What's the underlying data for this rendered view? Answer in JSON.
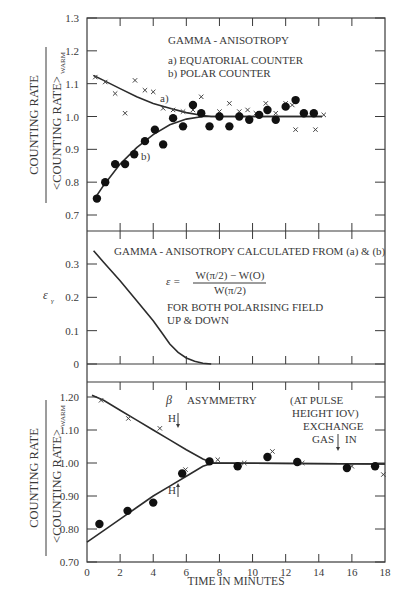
{
  "chart_data": [
    {
      "type": "scatter",
      "panel": "top",
      "title": "GAMMA - ANISOTROPY",
      "legend": [
        "a) EQUATORIAL COUNTER",
        "b) POLAR COUNTER"
      ],
      "curve_labels": [
        "a)",
        "b)"
      ],
      "xlabel": "",
      "ylabel_numerator": "COUNTING RATE",
      "ylabel_denominator": "<COUNTING RATE>",
      "ylabel_subscript": "WARM",
      "xlim": [
        0,
        18
      ],
      "ylim": [
        0.65,
        1.3
      ],
      "yticks": [
        "1.3",
        "1.2",
        "1.1",
        "1.0",
        "0.9",
        "0.8",
        "0.7"
      ],
      "series": [
        {
          "name": "a) EQUATORIAL COUNTER",
          "marker": "cross",
          "x": [
            0.5,
            1.1,
            1.7,
            2.3,
            2.9,
            3.5,
            4.0,
            4.6,
            5.2,
            5.8,
            6.9,
            6.4,
            8.0,
            8.6,
            9.2,
            9.7,
            10.2,
            10.8,
            11.4,
            12.0,
            12.4,
            12.6,
            13.8,
            14.3
          ],
          "y": [
            1.12,
            1.105,
            1.07,
            1.01,
            1.11,
            1.08,
            1.075,
            1.025,
            1.02,
            1.015,
            1.06,
            1.02,
            1.015,
            1.04,
            1.015,
            1.02,
            1.01,
            1.04,
            1.01,
            1.04,
            1.035,
            0.96,
            0.96,
            1.005
          ]
        },
        {
          "name": "b) POLAR COUNTER",
          "marker": "dot",
          "x": [
            0.6,
            1.1,
            1.7,
            2.3,
            2.85,
            3.5,
            4.1,
            4.6,
            5.2,
            5.8,
            6.4,
            6.9,
            7.4,
            8.0,
            8.6,
            9.2,
            9.8,
            10.4,
            10.9,
            11.4,
            12.0,
            12.6,
            13.1,
            13.7
          ],
          "y": [
            0.75,
            0.8,
            0.855,
            0.855,
            0.885,
            0.925,
            0.96,
            0.915,
            0.995,
            0.97,
            1.035,
            1.01,
            0.97,
            1.0,
            0.97,
            1.0,
            0.99,
            1.005,
            1.02,
            0.99,
            1.03,
            1.05,
            1.01,
            1.01
          ]
        },
        {
          "name": "fit a)",
          "marker": "line",
          "x": [
            0.4,
            1,
            2,
            3,
            4,
            5,
            6,
            7,
            7.5,
            14.2
          ],
          "y": [
            1.125,
            1.11,
            1.085,
            1.06,
            1.04,
            1.025,
            1.012,
            1.003,
            1.0,
            1.0
          ]
        },
        {
          "name": "fit b)",
          "marker": "line",
          "x": [
            0.4,
            1,
            2,
            3,
            4,
            5,
            6,
            7,
            7.5,
            14.2
          ],
          "y": [
            0.745,
            0.79,
            0.855,
            0.905,
            0.945,
            0.975,
            0.992,
            1.0,
            1.0,
            1.0
          ]
        }
      ]
    },
    {
      "type": "line",
      "panel": "middle",
      "title": "GAMMA - ANISOTROPY CALCULATED FROM (a) & (b)",
      "formula": {
        "lhs": "ε =",
        "numerator": "W(π/2)  −  W(O)",
        "denominator": "W(π/2)"
      },
      "note_lines": [
        "FOR BOTH POLARISING FIELD",
        "UP  &  DOWN"
      ],
      "ylabel": "εᵧ",
      "xlim": [
        0,
        18
      ],
      "ylim": [
        0,
        0.38
      ],
      "yticks": [
        "0.3",
        "0.2",
        "0.1",
        "0"
      ],
      "series": [
        {
          "name": "epsilon_gamma",
          "x": [
            0.4,
            1,
            2,
            3,
            4,
            4.5,
            5,
            5.5,
            6,
            6.5,
            7,
            7.5
          ],
          "y": [
            0.34,
            0.305,
            0.25,
            0.19,
            0.13,
            0.095,
            0.06,
            0.035,
            0.018,
            0.008,
            0.002,
            0.0
          ]
        }
      ]
    },
    {
      "type": "scatter",
      "panel": "bottom",
      "title": "β   ASYMMETRY",
      "annotations": [
        {
          "text": "H",
          "arrow": "down",
          "x": 5.4,
          "y": 1.115
        },
        {
          "text": "H",
          "arrow": "up",
          "x": 5.4,
          "y": 0.93
        },
        {
          "text": "(AT PULSE",
          "x": 14.6,
          "y": 1.18
        },
        {
          "text": "HEIGHT IOV)",
          "x": 14.6,
          "y": 1.14
        },
        {
          "text": "EXCHANGE",
          "x": 14.6,
          "y": 1.1
        },
        {
          "text": "GAS",
          "x": 14.6,
          "y": 1.065
        },
        {
          "text": "IN",
          "x": 14.6,
          "y": 1.065
        }
      ],
      "arrow_exchange_gas_x": 15.3,
      "xlabel": "TIME IN MINUTES",
      "ylabel_numerator": "COUNTING RATE",
      "ylabel_denominator": "<COUNTING RATE>",
      "ylabel_subscript": "WARM",
      "xlim": [
        0,
        18
      ],
      "ylim": [
        0.7,
        1.25
      ],
      "xticks": [
        "0",
        "2",
        "4",
        "6",
        "8",
        "10",
        "12",
        "14",
        "16",
        "18"
      ],
      "yticks": [
        "1.20",
        "1.10",
        "1.00",
        "0.90",
        "0.80",
        "0.70"
      ],
      "series": [
        {
          "name": "H down",
          "marker": "cross",
          "x": [
            0.85,
            2.5,
            4.4,
            5.95,
            7.9,
            9.5,
            11.2,
            13.0,
            16.0,
            17.9
          ],
          "y": [
            1.19,
            1.135,
            1.105,
            0.98,
            1.01,
            1.0,
            1.035,
            1.0,
            0.99,
            0.965
          ]
        },
        {
          "name": "H up",
          "marker": "dot",
          "x": [
            0.75,
            2.45,
            4.0,
            5.75,
            7.4,
            9.1,
            10.9,
            12.7,
            15.7,
            17.4
          ],
          "y": [
            0.815,
            0.855,
            0.88,
            0.968,
            1.005,
            0.99,
            1.018,
            1.003,
            0.985,
            0.99
          ]
        },
        {
          "name": "fit H down",
          "marker": "line",
          "x": [
            0.3,
            1,
            2,
            3,
            4,
            5,
            6,
            7,
            7.6,
            18
          ],
          "y": [
            1.205,
            1.19,
            1.16,
            1.13,
            1.1,
            1.07,
            1.04,
            1.012,
            1.0,
            0.997
          ]
        },
        {
          "name": "fit H up",
          "marker": "line",
          "x": [
            0,
            1,
            2,
            3,
            4,
            5,
            6,
            7,
            7.6,
            18
          ],
          "y": [
            0.76,
            0.795,
            0.83,
            0.865,
            0.9,
            0.93,
            0.96,
            0.99,
            1.0,
            0.997
          ]
        }
      ]
    }
  ],
  "labels": {
    "top_title": "GAMMA - ANISOTROPY",
    "top_legend_a": "a) EQUATORIAL COUNTER",
    "top_legend_b": "b) POLAR COUNTER",
    "curve_a": "a)",
    "curve_b": "b)",
    "ylabel_num": "COUNTING RATE",
    "ylabel_den": "<COUNTING RATE>",
    "ylabel_sub": "WARM",
    "mid_title": "GAMMA - ANISOTROPY CALCULATED FROM (a) & (b)",
    "mid_eps": "ε =",
    "mid_num": "W(π/2)  −  W(O)",
    "mid_den": "W(π/2)",
    "mid_note1": "FOR BOTH POLARISING FIELD",
    "mid_note2": "UP  &  DOWN",
    "mid_ylabel": "ε",
    "mid_ylabel_sub": "γ",
    "bot_beta": "β",
    "bot_title": "ASYMMETRY",
    "bot_h": "H",
    "bot_note1": "(AT PULSE",
    "bot_note2": "HEIGHT IOV)",
    "bot_note3": "EXCHANGE",
    "bot_gas": "GAS",
    "bot_in": "IN",
    "xlabel": "TIME IN MINUTES"
  }
}
